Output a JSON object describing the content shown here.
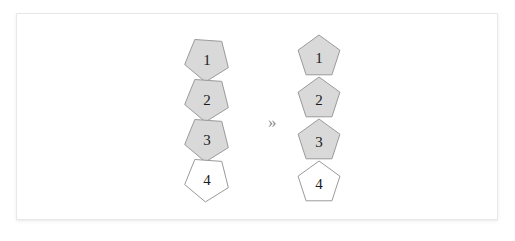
{
  "figure": {
    "background_color": "#ffffff",
    "card_border_color": "#e8e8e8",
    "arrow_glyph": "»",
    "arrow_name": "double-chevron-right",
    "filled_color": "#d9d9d9",
    "empty_color": "#ffffff",
    "stroke_color": "#9a9a9a",
    "label_color": "#1b1b1b",
    "groups": [
      {
        "name": "left-stack",
        "rotated": true,
        "rotation_degrees": -104,
        "center_x": 190,
        "nodes": [
          {
            "label": "1",
            "fill": "filled",
            "cx": 190,
            "cy": 45,
            "r": 23
          },
          {
            "label": "2",
            "fill": "filled",
            "cx": 190,
            "cy": 85,
            "r": 23
          },
          {
            "label": "3",
            "fill": "filled",
            "cx": 190,
            "cy": 125,
            "r": 23
          },
          {
            "label": "4",
            "fill": "empty",
            "cx": 190,
            "cy": 165,
            "r": 23
          }
        ]
      },
      {
        "name": "right-stack",
        "rotated": false,
        "rotation_degrees": 0,
        "center_x": 302,
        "nodes": [
          {
            "label": "1",
            "fill": "filled",
            "cx": 302,
            "cy": 43,
            "r": 22
          },
          {
            "label": "2",
            "fill": "filled",
            "cx": 302,
            "cy": 85,
            "r": 22
          },
          {
            "label": "3",
            "fill": "filled",
            "cx": 302,
            "cy": 127,
            "r": 22
          },
          {
            "label": "4",
            "fill": "empty",
            "cx": 302,
            "cy": 169,
            "r": 22
          }
        ]
      }
    ],
    "arrow": {
      "x": 251,
      "y": 100
    }
  }
}
